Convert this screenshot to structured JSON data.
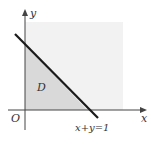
{
  "figure": {
    "axes": {
      "x_label": "x",
      "y_label": "y",
      "origin_label": "O"
    },
    "region_label": "D",
    "line_label": "x+y=1",
    "colors": {
      "background": "#ffffff",
      "square_fill": "#f2f2f2",
      "triangle_fill": "#d9d9d9",
      "line": "#1a1a1a",
      "axis": "#444444"
    }
  }
}
